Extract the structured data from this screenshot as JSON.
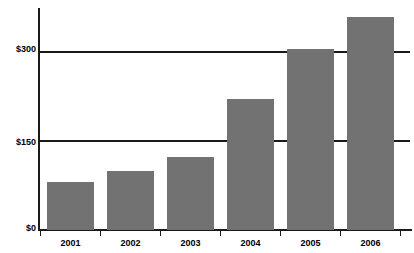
{
  "chart_data": {
    "type": "bar",
    "title": "",
    "xlabel": "",
    "ylabel": "",
    "categories": [
      "2001",
      "2002",
      "2003",
      "2004",
      "2005",
      "2006"
    ],
    "values": [
      81,
      100,
      124,
      222,
      306,
      359
    ],
    "ylim": [
      0,
      375
    ],
    "yticks": [
      0,
      150,
      300
    ],
    "ytick_labels": [
      "$0",
      "$150",
      "$300"
    ],
    "grid": true,
    "legend": "none",
    "bar_color": "#727272",
    "axis_color": "#1a1a1a",
    "background": "#ffffff"
  },
  "axes": {
    "y_ticks": [
      {
        "label": "$300",
        "value": 300
      },
      {
        "label": "$150",
        "value": 150
      },
      {
        "label": "$0",
        "value": 0
      }
    ],
    "x_ticks": [
      {
        "label": "2001"
      },
      {
        "label": "2002"
      },
      {
        "label": "2003"
      },
      {
        "label": "2004"
      },
      {
        "label": "2005"
      },
      {
        "label": "2006"
      }
    ]
  },
  "bars": [
    {
      "category": "2001",
      "value": 81
    },
    {
      "category": "2002",
      "value": 100
    },
    {
      "category": "2003",
      "value": 124
    },
    {
      "category": "2004",
      "value": 222
    },
    {
      "category": "2005",
      "value": 306
    },
    {
      "category": "2006",
      "value": 359
    }
  ]
}
